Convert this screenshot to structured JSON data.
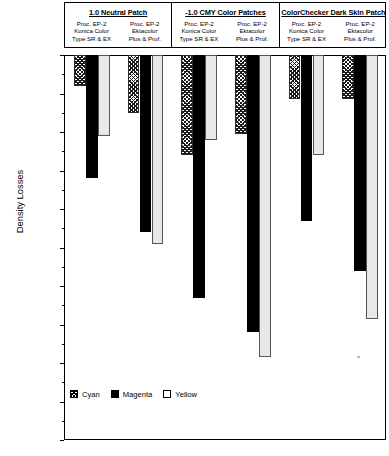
{
  "chart_data": {
    "type": "bar",
    "title": "",
    "xlabel": "",
    "ylabel": "Density Losses",
    "ylim": [
      -1.0,
      0.0
    ],
    "ytick_step": 0.1,
    "grid": false,
    "legend_position": "bottom-left",
    "orientation": "vertical-negative",
    "categories": [
      "1.0 Neutral Patch / Proc. EP-2 Konica Color Type SR & EX",
      "1.0 Neutral Patch / Proc. EP-2 Ektacolor Plus & Prof.",
      "-1.0 CMY Color Patches / Proc. EP-2 Konica Color Type SR & EX",
      "-1.0 CMY Color Patches / Proc. EP-2 Ektacolor Plus & Prof.",
      "ColorChecker Dark Skin Patch / Proc. EP-2 Konica Color Type SR & EX",
      "ColorChecker Dark Skin Patch / Proc. EP-2 Ektacolor Plus & Prof."
    ],
    "series": [
      {
        "name": "Cyan",
        "values": [
          -0.08,
          -0.15,
          -0.26,
          -0.205,
          -0.115,
          -0.115
        ]
      },
      {
        "name": "Magenta",
        "values": [
          -0.32,
          -0.46,
          -0.63,
          -0.72,
          -0.43,
          -0.56
        ]
      },
      {
        "name": "Yellow",
        "values": [
          -0.21,
          -0.49,
          -0.22,
          -0.785,
          -0.26,
          -0.685
        ]
      }
    ],
    "ytick_labels": [
      "0.00",
      "-0.10",
      "-0.20",
      "-0.30",
      "-0.40",
      "-0.50",
      "-0.60",
      "-0.70",
      "-0.80",
      "-0.90",
      "-1.00"
    ]
  },
  "header": {
    "groups": [
      {
        "title": "1.0 Neutral Patch",
        "columns": [
          {
            "line1": "Proc. EP-2",
            "line2": "Konica Color",
            "line3": "Type SR & EX"
          },
          {
            "line1": "Proc. EP-2",
            "line2": "Ektacolor",
            "line3": "Plus & Prof."
          }
        ]
      },
      {
        "title": "-1.0 CMY Color Patches",
        "columns": [
          {
            "line1": "Proc. EP-2",
            "line2": "Konica Color",
            "line3": "Type SR & EX"
          },
          {
            "line1": "Proc. EP-2",
            "line2": "Ektacolor",
            "line3": "Plus & Prof."
          }
        ]
      },
      {
        "title": "ColorChecker Dark Skin Patch",
        "columns": [
          {
            "line1": "Proc. EP-2",
            "line2": "Konica Color",
            "line3": "Type SR & EX"
          },
          {
            "line1": "Proc. EP-2",
            "line2": "Ektacolor",
            "line3": "Plus & Prof."
          }
        ]
      }
    ]
  },
  "legend": {
    "items": [
      {
        "label": "Cyan",
        "swatch": "cyan"
      },
      {
        "label": "Magenta",
        "swatch": "magenta"
      },
      {
        "label": "Yellow",
        "swatch": "yellow"
      }
    ]
  },
  "colors": {
    "cyan": "#ffffff",
    "magenta": "#000000",
    "yellow": "#e8e8e8",
    "axis": "#000000"
  }
}
